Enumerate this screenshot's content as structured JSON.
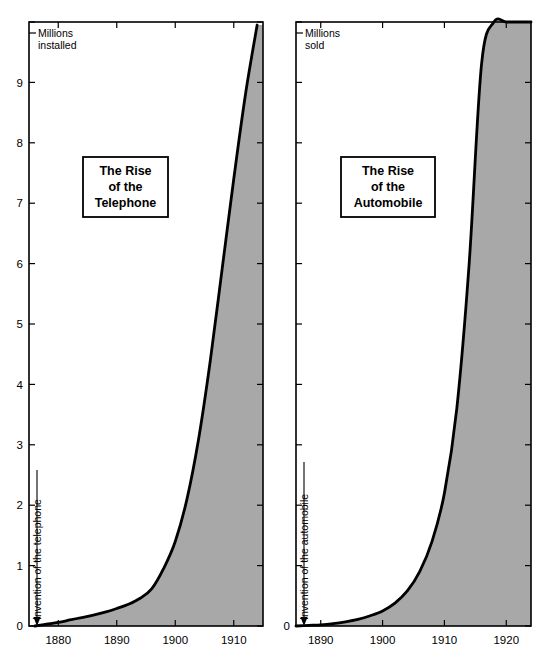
{
  "figure": {
    "background_color": "#ffffff",
    "fill_color": "#a8a8a8",
    "line_color": "#000000",
    "axis_color": "#000000"
  },
  "panels": [
    {
      "id": "telephone",
      "title_lines": [
        "The Rise",
        "of the",
        "Telephone"
      ],
      "unit_label_lines": [
        "Millions",
        "installed"
      ],
      "annotation": "Invention of the telephone",
      "annotation_year": 1876,
      "y_tick_labels": [
        "0",
        "1",
        "2",
        "3",
        "4",
        "5",
        "6",
        "7",
        "8",
        "9"
      ],
      "y_top_unlabeled_tick": "10",
      "x_tick_labels": [
        "1880",
        "1890",
        "1900",
        "1910"
      ]
    },
    {
      "id": "automobile",
      "title_lines": [
        "The Rise",
        "of the",
        "Automobile"
      ],
      "unit_label_lines": [
        "Millions",
        "sold"
      ],
      "annotation": "Invention of the automobile",
      "annotation_year": 1886,
      "y_tick_labels": [
        "0"
      ],
      "y_top_unlabeled_tick": "",
      "x_tick_labels": [
        "1890",
        "1900",
        "1910",
        "1920"
      ]
    }
  ],
  "chart_data": [
    {
      "type": "area",
      "title": "The Rise of the Telephone",
      "xlabel": "",
      "ylabel": "Millions installed",
      "xlim": [
        1875,
        1915
      ],
      "ylim": [
        0,
        10
      ],
      "xticks": [
        1880,
        1890,
        1900,
        1910
      ],
      "yticks": [
        0,
        1,
        2,
        3,
        4,
        5,
        6,
        7,
        8,
        9,
        10
      ],
      "ytick_labels": [
        "0",
        "1",
        "2",
        "3",
        "4",
        "5",
        "6",
        "7",
        "8",
        "9",
        ""
      ],
      "grid": false,
      "legend": "none",
      "annotations": [
        {
          "text": "Invention of the telephone",
          "x": 1876,
          "y": 0,
          "type": "arrow-down"
        }
      ],
      "x": [
        1876,
        1878,
        1880,
        1882,
        1884,
        1886,
        1888,
        1890,
        1892,
        1894,
        1896,
        1898,
        1900,
        1902,
        1904,
        1906,
        1908,
        1910,
        1912,
        1914
      ],
      "values": [
        0.0,
        0.03,
        0.06,
        0.1,
        0.14,
        0.18,
        0.23,
        0.29,
        0.36,
        0.46,
        0.62,
        0.95,
        1.4,
        2.1,
        3.1,
        4.4,
        5.9,
        7.4,
        8.8,
        9.95
      ]
    },
    {
      "type": "area",
      "title": "The Rise of the Automobile",
      "xlabel": "",
      "ylabel": "Millions sold",
      "xlim": [
        1886,
        1924
      ],
      "ylim": [
        0,
        10
      ],
      "xticks": [
        1890,
        1900,
        1910,
        1920
      ],
      "yticks": [
        0,
        1,
        2,
        3,
        4,
        5,
        6,
        7,
        8,
        9,
        10
      ],
      "ytick_labels": [
        "0",
        "",
        "",
        "",
        "",
        "",
        "",
        "",
        "",
        "",
        ""
      ],
      "grid": false,
      "legend": "none",
      "annotations": [
        {
          "text": "Invention of the automobile",
          "x": 1886,
          "y": 0,
          "type": "arrow-down"
        }
      ],
      "x": [
        1886,
        1888,
        1890,
        1892,
        1894,
        1896,
        1898,
        1900,
        1902,
        1904,
        1906,
        1908,
        1910,
        1912,
        1914,
        1916,
        1918,
        1920,
        1922,
        1924
      ],
      "values": [
        0.0,
        0.01,
        0.02,
        0.04,
        0.07,
        0.11,
        0.17,
        0.25,
        0.38,
        0.58,
        0.9,
        1.4,
        2.2,
        3.6,
        6.0,
        9.3,
        10.0,
        10.0,
        10.0,
        10.0
      ]
    }
  ]
}
